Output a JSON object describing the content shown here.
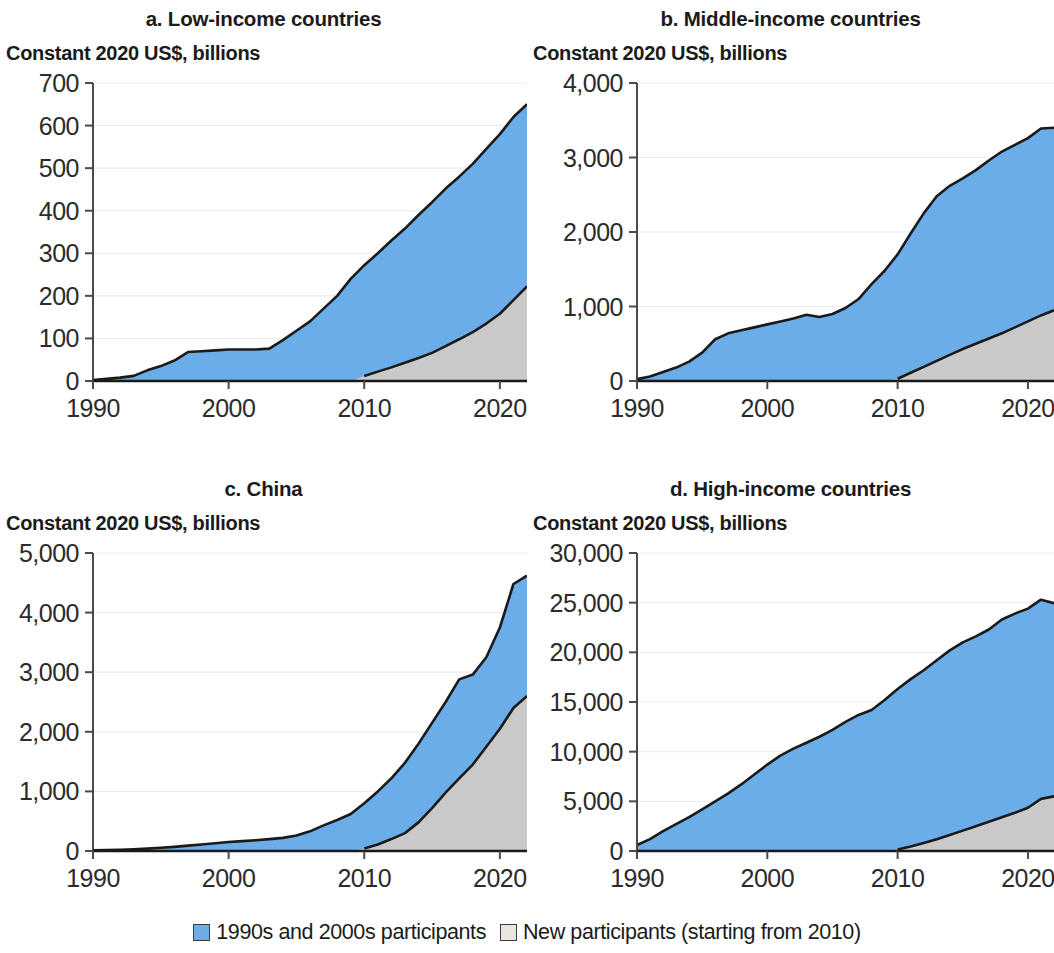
{
  "figure": {
    "colors": {
      "series_blue": "#6bade8",
      "series_gray": "#c9c9c9",
      "legend_gray_swatch": "#e8e6df",
      "outline": "#1a1a1a",
      "gridline": "#ededed",
      "axis": "#4a4a4a",
      "text": "#1b1b1b"
    }
  },
  "legend": {
    "position": "bottom-center",
    "items": [
      {
        "label": "1990s and 2000s participants",
        "color": "#6bade8",
        "swatch": "blue"
      },
      {
        "label": "New participants (starting from 2010)",
        "color": "#e8e6df",
        "swatch": "gray"
      }
    ]
  },
  "panels": {
    "a": {
      "title": "a. Low-income countries",
      "unit": "Constant 2020 US$, billions"
    },
    "b": {
      "title": "b. Middle-income countries",
      "unit": "Constant 2020 US$, billions"
    },
    "c": {
      "title": "c. China",
      "unit": "Constant 2020 US$, billions"
    },
    "d": {
      "title": "d. High-income countries",
      "unit": "Constant 2020 US$, billions"
    }
  },
  "chart_data": [
    {
      "id": "a",
      "type": "area",
      "stacked": true,
      "title": "a. Low-income countries",
      "subtitle": "Constant 2020 US$, billions",
      "xlabel": "",
      "ylabel": "Constant 2020 US$, billions",
      "xlim": [
        1990,
        2022
      ],
      "ylim": [
        0,
        700
      ],
      "ytick_labels": [
        "0",
        "100",
        "200",
        "300",
        "400",
        "500",
        "600",
        "700"
      ],
      "yticks": [
        0,
        100,
        200,
        300,
        400,
        500,
        600,
        700
      ],
      "xticks": [
        1990,
        2000,
        2010,
        2020
      ],
      "xtick_labels": [
        "1990",
        "2000",
        "2010",
        "2020"
      ],
      "grid": true,
      "legend_position": "figure-bottom",
      "x": [
        1990,
        1991,
        1992,
        1993,
        1994,
        1995,
        1996,
        1997,
        1998,
        1999,
        2000,
        2001,
        2002,
        2003,
        2004,
        2005,
        2006,
        2007,
        2008,
        2009,
        2010,
        2011,
        2012,
        2013,
        2014,
        2015,
        2016,
        2017,
        2018,
        2019,
        2020,
        2021,
        2022
      ],
      "series": [
        {
          "name": "New participants (starting from 2010)",
          "color": "#c9c9c9",
          "values": [
            0,
            0,
            0,
            0,
            0,
            0,
            0,
            0,
            0,
            0,
            0,
            0,
            0,
            0,
            0,
            0,
            0,
            0,
            0,
            0,
            12,
            22,
            32,
            43,
            54,
            66,
            82,
            98,
            115,
            135,
            158,
            190,
            222
          ]
        },
        {
          "name": "1990s and 2000s participants",
          "color": "#6bade8",
          "values": [
            2,
            5,
            8,
            12,
            25,
            35,
            48,
            68,
            70,
            72,
            74,
            74,
            74,
            76,
            96,
            118,
            140,
            170,
            200,
            240,
            272,
            300,
            330,
            358,
            390,
            420,
            452,
            480,
            510,
            545,
            580,
            620,
            650
          ]
        }
      ],
      "series_order_note": "blue is total (top boundary); gray is new-participants sub-area measured from zero"
    },
    {
      "id": "b",
      "type": "area",
      "stacked": true,
      "title": "b. Middle-income countries",
      "subtitle": "Constant 2020 US$, billions",
      "xlabel": "",
      "ylabel": "Constant 2020 US$, billions",
      "xlim": [
        1990,
        2022
      ],
      "ylim": [
        0,
        4000
      ],
      "ytick_labels": [
        "0",
        "1,000",
        "2,000",
        "3,000",
        "4,000"
      ],
      "yticks": [
        0,
        1000,
        2000,
        3000,
        4000
      ],
      "xticks": [
        1990,
        2000,
        2010,
        2020
      ],
      "xtick_labels": [
        "1990",
        "2000",
        "2010",
        "2020"
      ],
      "grid": true,
      "legend_position": "figure-bottom",
      "x": [
        1990,
        1991,
        1992,
        1993,
        1994,
        1995,
        1996,
        1997,
        1998,
        1999,
        2000,
        2001,
        2002,
        2003,
        2004,
        2005,
        2006,
        2007,
        2008,
        2009,
        2010,
        2011,
        2012,
        2013,
        2014,
        2015,
        2016,
        2017,
        2018,
        2019,
        2020,
        2021,
        2022
      ],
      "series": [
        {
          "name": "New participants (starting from 2010)",
          "color": "#c9c9c9",
          "values": [
            0,
            0,
            0,
            0,
            0,
            0,
            0,
            0,
            0,
            0,
            0,
            0,
            0,
            0,
            0,
            0,
            0,
            0,
            0,
            0,
            30,
            110,
            190,
            270,
            350,
            430,
            500,
            570,
            640,
            720,
            800,
            880,
            950
          ]
        },
        {
          "name": "1990s and 2000s participants",
          "color": "#6bade8",
          "values": [
            25,
            60,
            120,
            180,
            260,
            380,
            560,
            640,
            680,
            720,
            760,
            800,
            840,
            890,
            860,
            900,
            980,
            1100,
            1300,
            1480,
            1700,
            1980,
            2250,
            2480,
            2620,
            2720,
            2830,
            2960,
            3080,
            3170,
            3260,
            3390,
            3400
          ]
        }
      ]
    },
    {
      "id": "c",
      "type": "area",
      "stacked": true,
      "title": "c. China",
      "subtitle": "Constant 2020 US$, billions",
      "xlabel": "",
      "ylabel": "Constant 2020 US$, billions",
      "xlim": [
        1990,
        2022
      ],
      "ylim": [
        0,
        5000
      ],
      "ytick_labels": [
        "0",
        "1,000",
        "2,000",
        "3,000",
        "4,000",
        "5,000"
      ],
      "yticks": [
        0,
        1000,
        2000,
        3000,
        4000,
        5000
      ],
      "xticks": [
        1990,
        2000,
        2010,
        2020
      ],
      "xtick_labels": [
        "1990",
        "2000",
        "2010",
        "2020"
      ],
      "grid": true,
      "legend_position": "figure-bottom",
      "x": [
        1990,
        1991,
        1992,
        1993,
        1994,
        1995,
        1996,
        1997,
        1998,
        1999,
        2000,
        2001,
        2002,
        2003,
        2004,
        2005,
        2006,
        2007,
        2008,
        2009,
        2010,
        2011,
        2012,
        2013,
        2014,
        2015,
        2016,
        2017,
        2018,
        2019,
        2020,
        2021,
        2022
      ],
      "series": [
        {
          "name": "New participants (starting from 2010)",
          "color": "#c9c9c9",
          "values": [
            0,
            0,
            0,
            0,
            0,
            0,
            0,
            0,
            0,
            0,
            0,
            0,
            0,
            0,
            0,
            0,
            0,
            0,
            0,
            0,
            40,
            110,
            200,
            300,
            480,
            720,
            980,
            1220,
            1450,
            1750,
            2050,
            2400,
            2600
          ]
        },
        {
          "name": "1990s and 2000s participants",
          "color": "#6bade8",
          "values": [
            10,
            15,
            20,
            30,
            40,
            55,
            70,
            90,
            110,
            130,
            150,
            165,
            180,
            200,
            220,
            260,
            330,
            430,
            520,
            620,
            800,
            1000,
            1220,
            1480,
            1800,
            2150,
            2500,
            2880,
            2960,
            3250,
            3750,
            4480,
            4620
          ]
        }
      ]
    },
    {
      "id": "d",
      "type": "area",
      "stacked": true,
      "title": "d. High-income countries",
      "subtitle": "Constant 2020 US$, billions",
      "xlabel": "",
      "ylabel": "Constant 2020 US$, billions",
      "xlim": [
        1990,
        2022
      ],
      "ylim": [
        0,
        30000
      ],
      "ytick_labels": [
        "0",
        "5,000",
        "10,000",
        "15,000",
        "20,000",
        "25,000",
        "30,000"
      ],
      "yticks": [
        0,
        5000,
        10000,
        15000,
        20000,
        25000,
        30000
      ],
      "xticks": [
        1990,
        2000,
        2010,
        2020
      ],
      "xtick_labels": [
        "1990",
        "2000",
        "2010",
        "2020"
      ],
      "grid": true,
      "legend_position": "figure-bottom",
      "x": [
        1990,
        1991,
        1992,
        1993,
        1994,
        1995,
        1996,
        1997,
        1998,
        1999,
        2000,
        2001,
        2002,
        2003,
        2004,
        2005,
        2006,
        2007,
        2008,
        2009,
        2010,
        2011,
        2012,
        2013,
        2014,
        2015,
        2016,
        2017,
        2018,
        2019,
        2020,
        2021,
        2022
      ],
      "series": [
        {
          "name": "New participants (starting from 2010)",
          "color": "#c9c9c9",
          "values": [
            0,
            0,
            0,
            0,
            0,
            0,
            0,
            0,
            0,
            0,
            0,
            0,
            0,
            0,
            0,
            0,
            0,
            0,
            0,
            0,
            150,
            450,
            800,
            1180,
            1600,
            2050,
            2500,
            2950,
            3400,
            3850,
            4350,
            5250,
            5500
          ]
        },
        {
          "name": "1990s and 2000s participants",
          "color": "#6bade8",
          "values": [
            600,
            1200,
            2000,
            2700,
            3400,
            4200,
            5000,
            5800,
            6700,
            7700,
            8700,
            9600,
            10300,
            10900,
            11500,
            12200,
            13000,
            13700,
            14200,
            15200,
            16300,
            17300,
            18200,
            19200,
            20200,
            21000,
            21600,
            22300,
            23300,
            23900,
            24400,
            25300,
            24950
          ]
        }
      ]
    }
  ]
}
